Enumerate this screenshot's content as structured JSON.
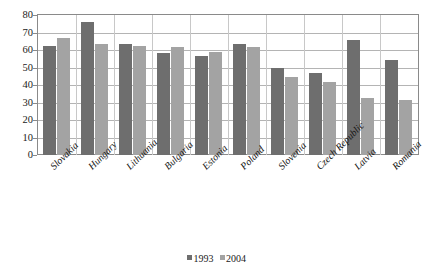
{
  "chart_data": {
    "type": "bar",
    "title": "",
    "xlabel": "",
    "ylabel": "",
    "ylim": [
      0,
      80
    ],
    "ytick_step": 10,
    "yticks": [
      "80",
      "70",
      "60",
      "50",
      "40",
      "30",
      "20",
      "10",
      "0"
    ],
    "grid": true,
    "legend_position": "bottom",
    "categories": [
      "Slovakia",
      "Hungary",
      "Lithuania",
      "Bulgaria",
      "Estonia",
      "Poland",
      "Slovenia",
      "Czech Republic",
      "Latvia",
      "Romania"
    ],
    "series": [
      {
        "name": "1993",
        "color": "#6e6e6e",
        "values": [
          62.5,
          76,
          63.5,
          58.5,
          56.5,
          63.5,
          50,
          47,
          65.5,
          54.5
        ]
      },
      {
        "name": "2004",
        "color": "#a3a3a3",
        "values": [
          67,
          63.5,
          62.5,
          61.5,
          59,
          62,
          44.5,
          41.5,
          32.5,
          31.5
        ]
      }
    ]
  },
  "legend": {
    "items": [
      {
        "label": "1993",
        "color": "#6e6e6e"
      },
      {
        "label": "2004",
        "color": "#a3a3a3"
      }
    ]
  }
}
